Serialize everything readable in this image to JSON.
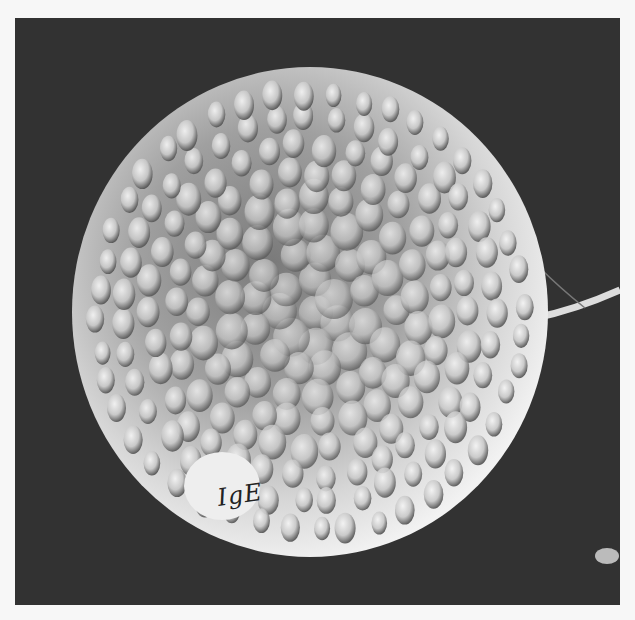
{
  "image": {
    "subject": "scanning electron micrograph of a spherical cell with knobby surface projections",
    "background_color": "#323232",
    "page_color": "#f7f7f7",
    "sphere_color": "#e8e8e8",
    "annotation": {
      "text": "IgE"
    },
    "features": [
      "spherical cell body",
      "bumpy granular surface",
      "fibrous strand at right edge",
      "small bright particle at bottom-right"
    ]
  }
}
